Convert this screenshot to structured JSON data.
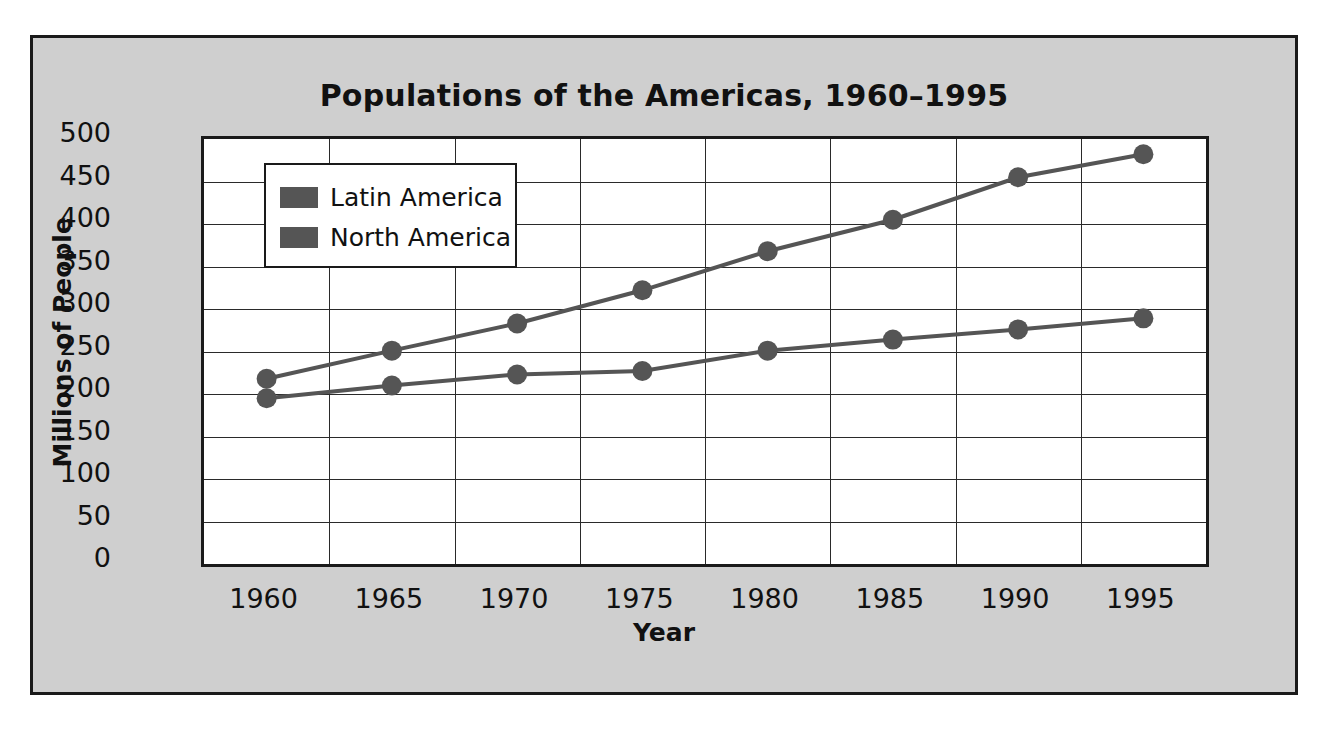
{
  "chart_data": {
    "type": "line",
    "title": "Populations of the Americas, 1960–1995",
    "xlabel": "Year",
    "ylabel": "Millions of People",
    "categories": [
      1960,
      1965,
      1970,
      1975,
      1980,
      1985,
      1990,
      1995
    ],
    "xtick_labels": [
      "1960",
      "1965",
      "1970",
      "1975",
      "1980",
      "1985",
      "1990",
      "1995"
    ],
    "ytick_labels": [
      "500",
      "450",
      "400",
      "350",
      "300",
      "250",
      "200",
      "150",
      "100",
      "50",
      "0"
    ],
    "ylim": [
      0,
      500
    ],
    "ytick_step": 50,
    "xlim": [
      1960,
      1995
    ],
    "grid": "horizontal-and-vertical",
    "legend_position": "upper-left-inside",
    "series": [
      {
        "name": "Latin America",
        "color": "#555555",
        "values": [
          218,
          251,
          283,
          322,
          368,
          405,
          455,
          482
        ]
      },
      {
        "name": "North America",
        "color": "#555555",
        "values": [
          195,
          210,
          223,
          227,
          251,
          264,
          276,
          289
        ]
      }
    ],
    "colors": {
      "figure_background": "#cfcfcf",
      "plot_background": "#ffffff",
      "frame": "#1a1a1a",
      "series_gray": "#555555"
    }
  },
  "legend": {
    "items": [
      {
        "label": "Latin America"
      },
      {
        "label": "North America"
      }
    ]
  }
}
